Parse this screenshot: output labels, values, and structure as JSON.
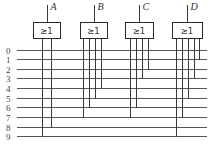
{
  "diagram": {
    "type": "OR-gate encoder",
    "input_lines": [
      "0",
      "1",
      "2",
      "3",
      "4",
      "5",
      "6",
      "7",
      "8",
      "9"
    ],
    "gates": [
      {
        "output": "A",
        "symbol": "≥1",
        "inputs": [
          9,
          8
        ]
      },
      {
        "output": "B",
        "symbol": "≥1",
        "inputs": [
          7,
          6,
          5,
          4
        ]
      },
      {
        "output": "C",
        "symbol": "≥1",
        "inputs": [
          7,
          6,
          3,
          2
        ]
      },
      {
        "output": "D",
        "symbol": "≥1",
        "inputs": [
          9,
          7,
          5,
          3,
          1
        ]
      }
    ]
  }
}
